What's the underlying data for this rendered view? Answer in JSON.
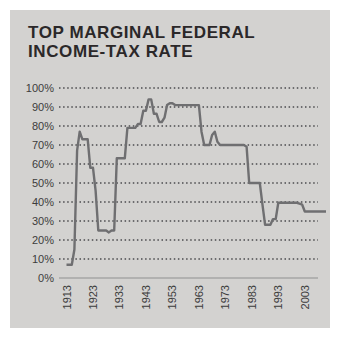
{
  "header": {
    "title_line1": "TOP MARGINAL FEDERAL",
    "title_line2": "INCOME-TAX RATE"
  },
  "colors": {
    "background": "#ffffff",
    "panel": "#d3d2d0",
    "title_text": "#2b2829",
    "axis_text": "#3c3c3c",
    "gridline": "#4b4b4d",
    "line": "#6f6f71",
    "zero_axis": "#909090"
  },
  "chart_data": {
    "type": "line",
    "title": "TOP MARGINAL FEDERAL INCOME-TAX RATE",
    "xlabel": "",
    "ylabel": "",
    "xlim": [
      1913,
      2011
    ],
    "ylim": [
      0,
      100
    ],
    "grid": "horizontal dotted",
    "legend_position": "none",
    "y_ticks": [
      {
        "value": 100,
        "label": "100%"
      },
      {
        "value": 90,
        "label": "90%"
      },
      {
        "value": 80,
        "label": "80%"
      },
      {
        "value": 70,
        "label": "70%"
      },
      {
        "value": 60,
        "label": "60%"
      },
      {
        "value": 50,
        "label": "50%"
      },
      {
        "value": 40,
        "label": "40%"
      },
      {
        "value": 30,
        "label": "30%"
      },
      {
        "value": 20,
        "label": "20%"
      },
      {
        "value": 10,
        "label": "10%"
      },
      {
        "value": 0,
        "label": "0%"
      }
    ],
    "x_ticks": [
      {
        "value": 1913,
        "label": "1913"
      },
      {
        "value": 1923,
        "label": "1923"
      },
      {
        "value": 1933,
        "label": "1933"
      },
      {
        "value": 1943,
        "label": "1943"
      },
      {
        "value": 1953,
        "label": "1953"
      },
      {
        "value": 1963,
        "label": "1963"
      },
      {
        "value": 1973,
        "label": "1973"
      },
      {
        "value": 1983,
        "label": "1983"
      },
      {
        "value": 1993,
        "label": "1993"
      },
      {
        "value": 2003,
        "label": "2003"
      }
    ],
    "series": [
      {
        "name": "Top marginal federal income-tax rate (%)",
        "x": [
          1913,
          1914,
          1915,
          1916,
          1917,
          1918,
          1919,
          1920,
          1921,
          1922,
          1923,
          1924,
          1925,
          1926,
          1927,
          1928,
          1929,
          1930,
          1931,
          1932,
          1933,
          1934,
          1935,
          1936,
          1937,
          1938,
          1939,
          1940,
          1941,
          1942,
          1943,
          1944,
          1945,
          1946,
          1947,
          1948,
          1949,
          1950,
          1951,
          1952,
          1953,
          1954,
          1955,
          1956,
          1957,
          1958,
          1959,
          1960,
          1961,
          1962,
          1963,
          1964,
          1965,
          1966,
          1967,
          1968,
          1969,
          1970,
          1971,
          1972,
          1973,
          1974,
          1975,
          1976,
          1977,
          1978,
          1979,
          1980,
          1981,
          1982,
          1983,
          1984,
          1985,
          1986,
          1987,
          1988,
          1989,
          1990,
          1991,
          1992,
          1993,
          1994,
          1995,
          1996,
          1997,
          1998,
          1999,
          2000,
          2001,
          2002,
          2003,
          2004,
          2005,
          2006,
          2007,
          2008,
          2009,
          2010,
          2011
        ],
        "y": [
          7,
          7,
          7,
          15,
          67,
          77,
          73,
          73,
          73,
          58,
          58,
          46,
          25,
          25,
          25,
          25,
          24,
          25,
          25,
          63,
          63,
          63,
          63,
          79,
          79,
          79,
          79,
          81.1,
          81,
          88,
          88,
          94,
          94,
          86.45,
          86.45,
          82.13,
          82.13,
          84.36,
          91,
          92,
          92,
          91,
          91,
          91,
          91,
          91,
          91,
          91,
          91,
          91,
          91,
          77,
          70,
          70,
          70,
          75.25,
          77,
          71.75,
          70,
          70,
          70,
          70,
          70,
          70,
          70,
          70,
          70,
          70,
          69.13,
          50,
          50,
          50,
          50,
          50,
          38.5,
          28,
          28,
          28,
          31,
          31,
          39.6,
          39.6,
          39.6,
          39.6,
          39.6,
          39.6,
          39.6,
          39.6,
          39.1,
          38.6,
          35,
          35,
          35,
          35,
          35,
          35,
          35,
          35,
          35
        ]
      }
    ]
  }
}
